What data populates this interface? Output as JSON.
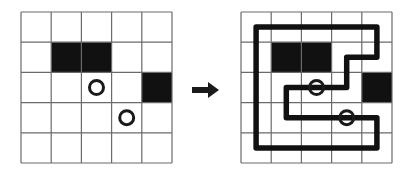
{
  "diagram": {
    "type": "grid-loop-puzzle",
    "grid_rows": 5,
    "grid_cols": 5,
    "colors": {
      "background": "#ffffff",
      "grid_line": "#6a6a6a",
      "black_cell": "#111111",
      "circle": "#1a1a1a",
      "path": "#111111",
      "arrow": "#1a1a1a"
    },
    "left_panel": {
      "label": "puzzle",
      "origin": [
        21,
        12
      ],
      "cell_size": 30.2,
      "black_cells": [
        {
          "row": 1,
          "col": 1
        },
        {
          "row": 1,
          "col": 2
        },
        {
          "row": 2,
          "col": 4
        }
      ],
      "circles": [
        {
          "row": 2,
          "col": 2
        },
        {
          "row": 3,
          "col": 3
        }
      ]
    },
    "arrow": {
      "direction": "right",
      "from": [
        192,
        90
      ],
      "to": [
        219,
        90
      ]
    },
    "right_panel": {
      "label": "solution",
      "origin": [
        241,
        12
      ],
      "cell_size": 30.2,
      "black_cells": [
        {
          "row": 1,
          "col": 1
        },
        {
          "row": 1,
          "col": 2
        },
        {
          "row": 2,
          "col": 4
        }
      ],
      "circles": [
        {
          "row": 2,
          "col": 2
        },
        {
          "row": 3,
          "col": 3
        }
      ],
      "path_cells": [
        [
          0,
          0
        ],
        [
          0,
          1
        ],
        [
          0,
          2
        ],
        [
          0,
          3
        ],
        [
          0,
          4
        ],
        [
          1,
          4
        ],
        [
          1,
          3
        ],
        [
          2,
          3
        ],
        [
          2,
          2
        ],
        [
          2,
          1
        ],
        [
          3,
          1
        ],
        [
          3,
          2
        ],
        [
          3,
          3
        ],
        [
          3,
          4
        ],
        [
          4,
          4
        ],
        [
          4,
          3
        ],
        [
          4,
          2
        ],
        [
          4,
          1
        ],
        [
          4,
          0
        ],
        [
          3,
          0
        ],
        [
          2,
          0
        ],
        [
          1,
          0
        ],
        [
          0,
          0
        ]
      ]
    }
  }
}
